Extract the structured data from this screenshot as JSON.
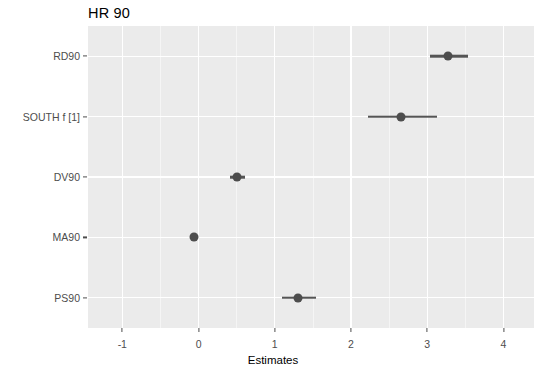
{
  "chart_data": {
    "type": "scatter",
    "title": "HR 90",
    "xlabel": "Estimates",
    "ylabel": "",
    "xlim": [
      -1.45,
      4.4
    ],
    "ylim": [
      0,
      5
    ],
    "grid": true,
    "legend": null,
    "x_ticks": [
      -1,
      0,
      1,
      2,
      3,
      4
    ],
    "x_tick_labels": [
      "-1",
      "0",
      "1",
      "2",
      "3",
      "4"
    ],
    "categories": [
      "PS90",
      "MA90",
      "DV90",
      "SOUTH f [1]",
      "RD90"
    ],
    "series": [
      {
        "name": "Estimates",
        "point_color": "#4d4d4d",
        "line_color": "#555555",
        "points": [
          {
            "label": "RD90",
            "estimate": 3.27,
            "low": 3.03,
            "high": 3.54
          },
          {
            "label": "SOUTH f [1]",
            "estimate": 2.66,
            "low": 2.22,
            "high": 3.13
          },
          {
            "label": "DV90",
            "estimate": 0.51,
            "low": 0.41,
            "high": 0.61
          },
          {
            "label": "MA90",
            "estimate": -0.06,
            "low": -0.09,
            "high": -0.03
          },
          {
            "label": "PS90",
            "estimate": 1.3,
            "low": 1.1,
            "high": 1.54
          }
        ]
      }
    ],
    "panel_background": "#ebebeb",
    "gridline_color": "#ffffff"
  },
  "axes": {
    "y_tick_labels": [
      "RD90",
      "SOUTH f [1]",
      "DV90",
      "MA90",
      "PS90"
    ],
    "x_tick_labels": [
      "-1",
      "0",
      "1",
      "2",
      "3",
      "4"
    ],
    "x_title": "Estimates"
  }
}
